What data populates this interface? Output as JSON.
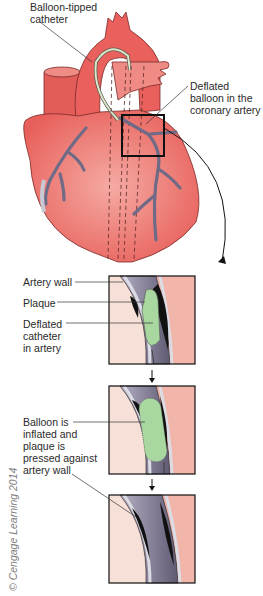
{
  "diagram": {
    "heart_labels": {
      "catheter": "Balloon-tipped\ncatheter",
      "balloon": "Deflated\nballoon in the\ncoronary artery"
    },
    "panel1_labels": {
      "artery_wall": "Artery wall",
      "plaque": "Plaque",
      "catheter": "Deflated\ncatheter\nin artery"
    },
    "panel2_labels": {
      "balloon": "Balloon is\ninflated and\nplaque is\npressed against\nartery wall"
    },
    "copyright": "© Cengage Learning 2014",
    "colors": {
      "heart": "#e9605c",
      "heart_light": "#f3a29a",
      "vessel": "#6f6a86",
      "plaque": "#a8d8a0",
      "lumen": "#8a849c",
      "tissue_left": "#f7e0d8",
      "tissue_right": "#f1b5aa"
    }
  }
}
